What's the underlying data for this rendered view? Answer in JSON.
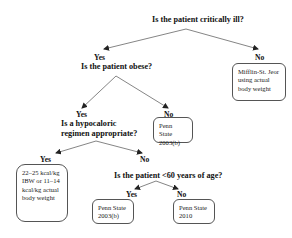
{
  "diagram": {
    "type": "decision-tree",
    "nodes": {
      "q1": {
        "text": "Is the patient critically ill?"
      },
      "q1_yes": {
        "text": "Yes"
      },
      "q1_no": {
        "text": "No"
      },
      "q2": {
        "text": "Is the patient obese?"
      },
      "out_mifflin": {
        "lines": [
          "Mifflin-St. Jeor",
          "using actual",
          "body weight"
        ]
      },
      "q2_yes": {
        "text": "Yes"
      },
      "q2_no": {
        "text": "No"
      },
      "q3": {
        "lines": [
          "Is a hypocaloric",
          "regimen appropriate?"
        ]
      },
      "out_penn2003b_nonobese": {
        "lines": [
          "Penn State",
          "2003(b)"
        ]
      },
      "q3_yes": {
        "text": "Yes"
      },
      "q3_no": {
        "text": "No"
      },
      "out_hypocaloric": {
        "lines": [
          "22–25 kcal/kg",
          "IBW or 11–14",
          "kcal/kg actual",
          "body weight"
        ]
      },
      "q4": {
        "text": "Is the patient <60 years of age?"
      },
      "q4_yes": {
        "text": "Yes"
      },
      "q4_no": {
        "text": "No"
      },
      "out_penn2003b_young": {
        "lines": [
          "Penn State",
          "2003(b)"
        ]
      },
      "out_penn2010": {
        "lines": [
          "Penn State",
          "2010"
        ]
      }
    },
    "edges": [
      {
        "from": "q1",
        "to": "q2",
        "label": "Yes"
      },
      {
        "from": "q1",
        "to": "out_mifflin",
        "label": "No"
      },
      {
        "from": "q2",
        "to": "q3",
        "label": "Yes"
      },
      {
        "from": "q2",
        "to": "out_penn2003b_nonobese",
        "label": "No"
      },
      {
        "from": "q3",
        "to": "out_hypocaloric",
        "label": "Yes"
      },
      {
        "from": "q3",
        "to": "q4",
        "label": "No"
      },
      {
        "from": "q4",
        "to": "out_penn2003b_young",
        "label": "Yes"
      },
      {
        "from": "q4",
        "to": "out_penn2010",
        "label": "No"
      }
    ],
    "colors": {
      "line": "#555555",
      "text": "#111111",
      "box_border": "#555555"
    }
  }
}
